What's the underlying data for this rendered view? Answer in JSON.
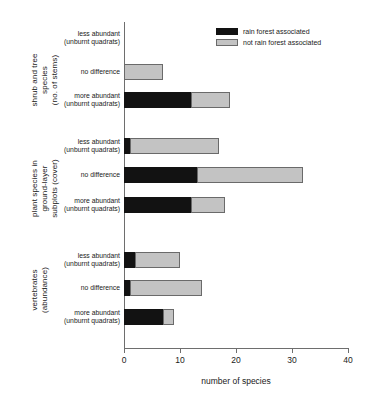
{
  "chart_data": {
    "type": "bar",
    "orientation": "horizontal",
    "stacked": true,
    "title": "",
    "xlabel": "number of species",
    "ylabel": "",
    "xlim": [
      0,
      40
    ],
    "xticks": [
      0,
      10,
      20,
      30,
      40
    ],
    "grid": false,
    "legend": {
      "position": "top-right",
      "entries": [
        {
          "name": "rain forest associated",
          "color": "#121212"
        },
        {
          "name": "not rain forest associated",
          "color": "#c3c3c3"
        }
      ]
    },
    "series": [
      {
        "name": "rain forest associated",
        "color": "#121212"
      },
      {
        "name": "not rain forest associated",
        "color": "#c3c3c3"
      }
    ],
    "groups": [
      {
        "label": "shrub and tree\nspecies\n(no. of stems)",
        "categories": [
          {
            "label": "less abundant\n(unburnt quadrats)",
            "values": [
              0,
              0
            ]
          },
          {
            "label": "no difference",
            "values": [
              0,
              7
            ]
          },
          {
            "label": "more abundant\n(unburnt quadrats)",
            "values": [
              12,
              7
            ]
          }
        ]
      },
      {
        "label": "plant species in\nground-layer\nsubplots (cover)",
        "categories": [
          {
            "label": "less abundant\n(unburnt quadrats)",
            "values": [
              1,
              16
            ]
          },
          {
            "label": "no difference",
            "values": [
              13,
              19
            ]
          },
          {
            "label": "more abundant\n(unburnt quadrats)",
            "values": [
              12,
              6
            ]
          }
        ]
      },
      {
        "label": "vertebrates\n(abundance)",
        "categories": [
          {
            "label": "less abundant\n(unburnt quadrats)",
            "values": [
              2,
              8
            ]
          },
          {
            "label": "no difference",
            "values": [
              1,
              13
            ]
          },
          {
            "label": "more abundant\n(unburnt quadrats)",
            "values": [
              7,
              2
            ]
          }
        ]
      }
    ]
  },
  "axis": {
    "x_title": "number of species",
    "tick_labels": [
      "0",
      "10",
      "20",
      "30",
      "40"
    ]
  },
  "legend": {
    "item_0": "rain forest associated",
    "item_1": "not rain forest associated"
  }
}
